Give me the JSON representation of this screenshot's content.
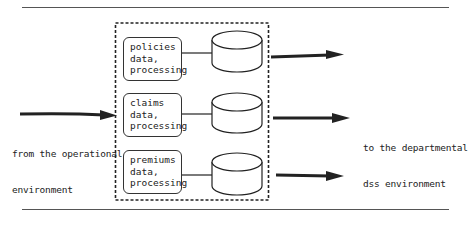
{
  "diagram": {
    "source_label": [
      "from the operational",
      "environment"
    ],
    "target_label": [
      "to the departmental",
      "dss environment"
    ],
    "groups": [
      {
        "lines": [
          "policies",
          "data,",
          "processing"
        ]
      },
      {
        "lines": [
          "claims",
          "data,",
          "processing"
        ]
      },
      {
        "lines": [
          "premiums",
          "data,",
          "processing"
        ]
      }
    ],
    "colors": {
      "stroke": "#222222",
      "background": "#ffffff"
    }
  }
}
